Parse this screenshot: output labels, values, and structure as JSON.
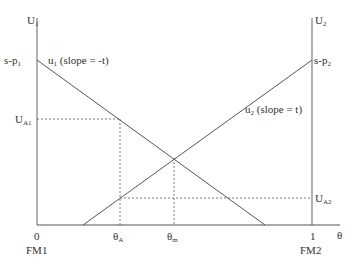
{
  "axes": {
    "left_axis_label": "U",
    "left_axis_sub": "1",
    "right_axis_label": "U",
    "right_axis_sub": "2",
    "x_axis_label": "θ",
    "origin_label": "0",
    "origin_firm": "FM1",
    "end_label": "1",
    "end_firm": "FM2"
  },
  "curves": {
    "u1": {
      "name": "u",
      "sub": "1",
      "desc": " (slope = -t)",
      "intercept_label": "s-p",
      "intercept_sub": "1"
    },
    "u2": {
      "name": "u",
      "sub": "2",
      "desc": " (slope = t)",
      "intercept_label": "s-p",
      "intercept_sub": "2"
    }
  },
  "markers": {
    "ua1": {
      "label": "U",
      "sub": "A1"
    },
    "ua2": {
      "label": "U",
      "sub": "A2"
    },
    "theta_a": {
      "label": "θ",
      "sub": "A"
    },
    "theta_m": {
      "label": "θ",
      "sub": "m"
    }
  },
  "colors": {
    "line": "#555555",
    "axis": "#888888"
  }
}
